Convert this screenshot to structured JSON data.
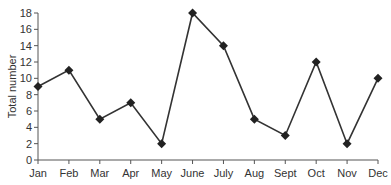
{
  "chart_data": {
    "type": "line",
    "title": "",
    "xlabel": "",
    "ylabel": "Total number",
    "categories": [
      "Jan",
      "Feb",
      "Mar",
      "Apr",
      "May",
      "June",
      "July",
      "Aug",
      "Sept",
      "Oct",
      "Nov",
      "Dec"
    ],
    "series": [
      {
        "name": "Total number",
        "values": [
          9,
          11,
          5,
          7,
          2,
          18,
          14,
          5,
          3,
          12,
          2,
          10
        ]
      }
    ],
    "ylim": [
      0,
      18
    ],
    "yticks": [
      0,
      2,
      4,
      6,
      8,
      10,
      12,
      14,
      16,
      18
    ],
    "grid": false,
    "legend": "none",
    "marker": "diamond",
    "colors": {
      "line": "#333333",
      "marker": "#222222",
      "axis": "#555555"
    }
  }
}
